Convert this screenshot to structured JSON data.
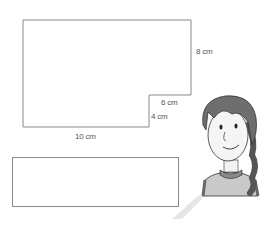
{
  "shape": {
    "type": "L-shape",
    "dimensions": {
      "height_label": "8 cm",
      "step_width_label": "6 cm",
      "step_height_label": "4 cm",
      "base_label": "10 cm"
    }
  },
  "answer_box": {
    "value": ""
  },
  "character": {
    "description": "girl with braid"
  },
  "colors": {
    "line": "#8a8a8a",
    "text": "#555555"
  }
}
